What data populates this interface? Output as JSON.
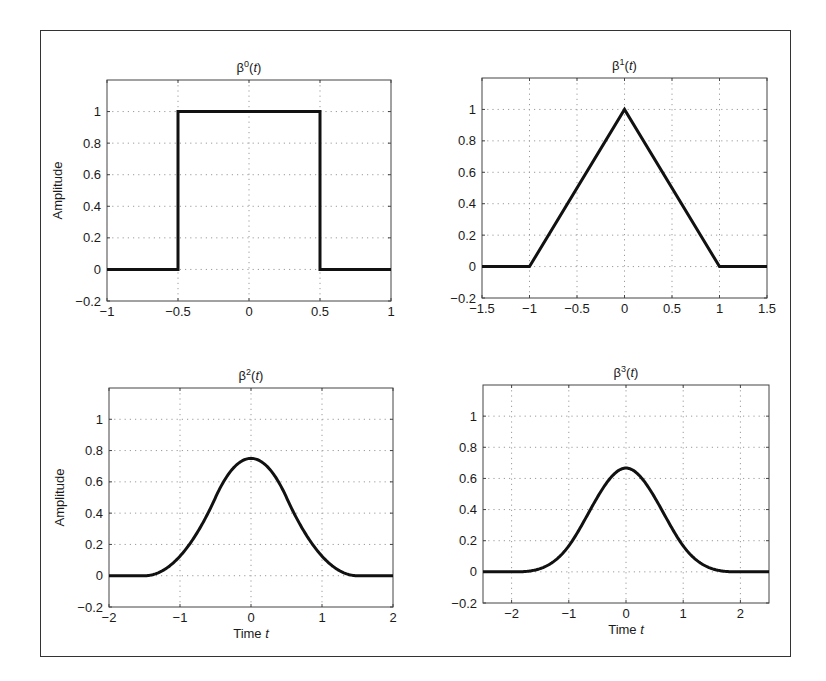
{
  "figure": {
    "colors": {
      "line": "#111111",
      "axes": "#444444",
      "grid": "#9a9a9a",
      "frame": "#333333"
    }
  },
  "chart_data": [
    {
      "type": "line",
      "title": "β⁰(t)",
      "title_base": "β",
      "title_sup": "0",
      "title_arg": "t",
      "xlabel": "",
      "ylabel": "Amplitude",
      "xlim": [
        -1,
        1
      ],
      "ylim": [
        -0.2,
        1.2
      ],
      "xticks": [
        -1,
        -0.5,
        0,
        0.5,
        1
      ],
      "xtick_labels": [
        "−1",
        "−0.5",
        "0",
        "0.5",
        "1"
      ],
      "yticks": [
        -0.2,
        0,
        0.2,
        0.4,
        0.6,
        0.8,
        1
      ],
      "ytick_labels": [
        "−0.2",
        "0",
        "0.2",
        "0.4",
        "0.6",
        "0.8",
        "1"
      ],
      "grid": true,
      "function": "bspline0",
      "x": [
        -1,
        -0.5,
        -0.5,
        0.5,
        0.5,
        1
      ],
      "y": [
        0,
        0,
        1,
        1,
        0,
        0
      ]
    },
    {
      "type": "line",
      "title": "β¹(t)",
      "title_base": "β",
      "title_sup": "1",
      "title_arg": "t",
      "xlabel": "",
      "ylabel": "",
      "xlim": [
        -1.5,
        1.5
      ],
      "ylim": [
        -0.2,
        1.2
      ],
      "xticks": [
        -1.5,
        -1,
        -0.5,
        0,
        0.5,
        1,
        1.5
      ],
      "xtick_labels": [
        "−1.5",
        "−1",
        "−0.5",
        "0",
        "0.5",
        "1",
        "1.5"
      ],
      "yticks": [
        -0.2,
        0,
        0.2,
        0.4,
        0.6,
        0.8,
        1
      ],
      "ytick_labels": [
        "−0.2",
        "0",
        "0.2",
        "0.4",
        "0.6",
        "0.8",
        "1"
      ],
      "grid": true,
      "function": "bspline1",
      "x": [
        -1.5,
        -1,
        0,
        1,
        1.5
      ],
      "y": [
        0,
        0,
        1,
        0,
        0
      ]
    },
    {
      "type": "line",
      "title": "β²(t)",
      "title_base": "β",
      "title_sup": "2",
      "title_arg": "t",
      "xlabel": "Time t",
      "xlabel_base": "Time ",
      "xlabel_var": "t",
      "ylabel": "Amplitude",
      "xlim": [
        -2,
        2
      ],
      "ylim": [
        -0.2,
        1.2
      ],
      "xticks": [
        -2,
        -1,
        0,
        1,
        2
      ],
      "xtick_labels": [
        "−2",
        "−1",
        "0",
        "1",
        "2"
      ],
      "yticks": [
        -0.2,
        0,
        0.2,
        0.4,
        0.6,
        0.8,
        1
      ],
      "ytick_labels": [
        "−0.2",
        "0",
        "0.2",
        "0.4",
        "0.6",
        "0.8",
        "1"
      ],
      "grid": true,
      "function": "bspline2",
      "x": [
        -2,
        -1.5,
        -1,
        -0.5,
        0,
        0.5,
        1,
        1.5,
        2
      ],
      "y": [
        0,
        0,
        0.125,
        0.5,
        0.75,
        0.5,
        0.125,
        0,
        0
      ]
    },
    {
      "type": "line",
      "title": "β³(t)",
      "title_base": "β",
      "title_sup": "3",
      "title_arg": "t",
      "xlabel": "Time t",
      "xlabel_base": "Time ",
      "xlabel_var": "t",
      "ylabel": "",
      "xlim": [
        -2.5,
        2.5
      ],
      "ylim": [
        -0.2,
        1.2
      ],
      "xticks": [
        -2,
        -1,
        0,
        1,
        2
      ],
      "xtick_labels": [
        "−2",
        "−1",
        "0",
        "1",
        "2"
      ],
      "yticks": [
        -0.2,
        0,
        0.2,
        0.4,
        0.6,
        0.8,
        1
      ],
      "ytick_labels": [
        "−0.2",
        "0",
        "0.2",
        "0.4",
        "0.6",
        "0.8",
        "1"
      ],
      "grid": true,
      "function": "bspline3",
      "x": [
        -2.5,
        -2,
        -1.5,
        -1,
        -0.5,
        0,
        0.5,
        1,
        1.5,
        2,
        2.5
      ],
      "y": [
        0,
        0,
        0.0208,
        0.1667,
        0.4792,
        0.6667,
        0.4792,
        0.1667,
        0.0208,
        0,
        0
      ]
    }
  ]
}
